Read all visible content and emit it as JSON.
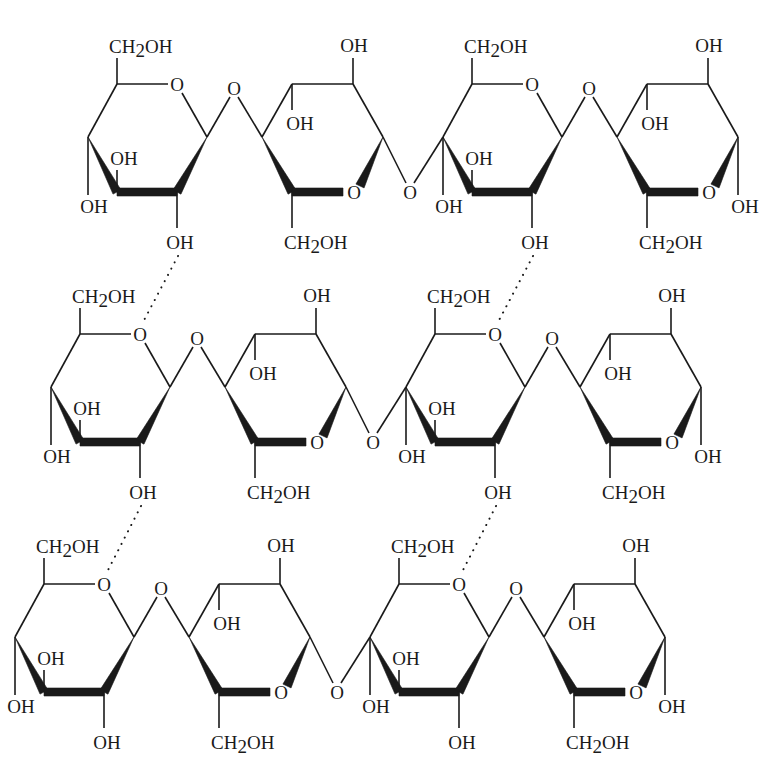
{
  "figure": {
    "rows": 3,
    "units_per_row": 4,
    "row_offsets": [
      {
        "dx": 0,
        "dy": 0
      },
      {
        "dx": -37,
        "dy": 250
      },
      {
        "dx": -73,
        "dy": 500
      }
    ],
    "labels": {
      "ch2oh_main": "CH",
      "ch2oh_sub": "2",
      "ch2oh_tail": "OH",
      "hydroxyl": "OH",
      "oxygen": "O"
    },
    "hydrogen_bonds": [
      {
        "from_row": 0,
        "to_row": 1,
        "unit": 1,
        "style": "dotted"
      },
      {
        "from_row": 0,
        "to_row": 1,
        "unit": 3,
        "style": "dotted"
      },
      {
        "from_row": 1,
        "to_row": 2,
        "unit": 1,
        "style": "dotted"
      },
      {
        "from_row": 1,
        "to_row": 2,
        "unit": 3,
        "style": "dotted"
      }
    ],
    "linkage": "β(1→4) glycosidic",
    "stroke_color": "#1a1a1a",
    "background": "#ffffff"
  }
}
